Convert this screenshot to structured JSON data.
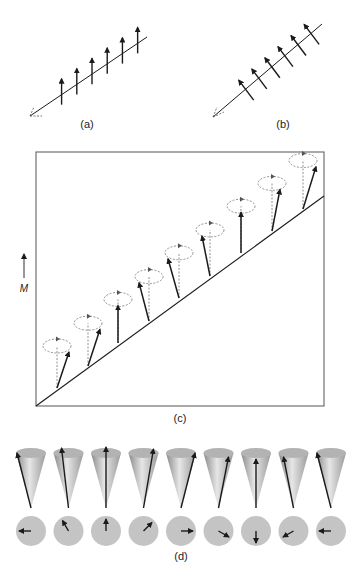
{
  "panels": {
    "a": {
      "label": "(a)",
      "spin_count": 6
    },
    "b": {
      "label": "(b)",
      "spin_count": 6
    },
    "c": {
      "label": "(c)",
      "axis_label": "M",
      "spin_count": 9
    },
    "d": {
      "label": "(d)",
      "cone_count": 9,
      "arrow_directions": [
        "left",
        "up-left",
        "up",
        "up-right",
        "right",
        "down-right",
        "down",
        "down-left",
        "left"
      ]
    }
  },
  "colors": {
    "ink": "#1a1a1a",
    "dashed": "#777777",
    "cone": "#bdbdbd",
    "disc": "#c4c4c4",
    "frame": "#555555"
  }
}
